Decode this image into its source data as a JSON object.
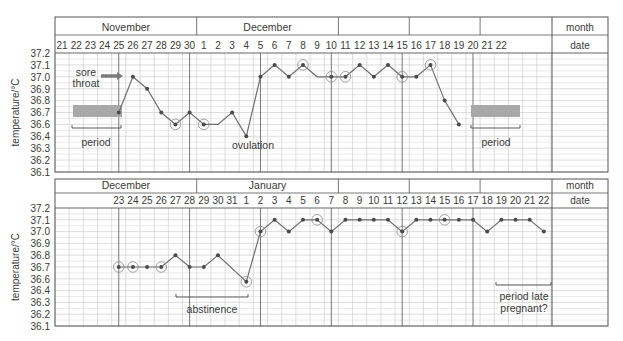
{
  "chart_data": [
    {
      "type": "line",
      "title": "Basal body temperature chart (cycle 1)",
      "ylabel": "temperature/°C",
      "y_ticks": [
        "37.2",
        "37.1",
        "37.0",
        "36.9",
        "36.8",
        "36.7",
        "36.6",
        "36.4",
        "36.3",
        "36.2",
        "36.1"
      ],
      "header_label_month": "month",
      "header_label_date": "date",
      "months": [
        {
          "label": "November",
          "from_col": 0,
          "to_col": 10
        },
        {
          "label": "December",
          "from_col": 10,
          "to_col": 20
        },
        {
          "label": "",
          "from_col": 20,
          "to_col": 25
        },
        {
          "label": "",
          "from_col": 25,
          "to_col": 30
        },
        {
          "label": "",
          "from_col": 30,
          "to_col": 35
        }
      ],
      "dates": [
        "21",
        "22",
        "23",
        "24",
        "25",
        "26",
        "27",
        "28",
        "29",
        "30",
        "1",
        "2",
        "3",
        "4",
        "5",
        "6",
        "7",
        "8",
        "9",
        "10",
        "11",
        "12",
        "13",
        "14",
        "15",
        "16",
        "17",
        "18",
        "19",
        "20",
        "21",
        "22"
      ],
      "series": [
        {
          "name": "temperature",
          "points": [
            {
              "col": 4,
              "date": "Nov 25",
              "value": 36.7,
              "circled": false,
              "marker": true
            },
            {
              "col": 5,
              "date": "Nov 26",
              "value": 37.0,
              "circled": false,
              "marker": true
            },
            {
              "col": 6,
              "date": "Nov 27",
              "value": 36.9,
              "circled": false,
              "marker": true
            },
            {
              "col": 7,
              "date": "Nov 28",
              "value": 36.7,
              "circled": false,
              "marker": true
            },
            {
              "col": 8,
              "date": "Nov 29",
              "value": 36.6,
              "circled": true,
              "marker": true
            },
            {
              "col": 9,
              "date": "Nov 30",
              "value": 36.7,
              "circled": false,
              "marker": true
            },
            {
              "col": 10,
              "date": "Dec 1",
              "value": 36.6,
              "circled": true,
              "marker": true
            },
            {
              "col": 11,
              "date": "Dec 2",
              "value": 36.6,
              "circled": false,
              "marker": false
            },
            {
              "col": 12,
              "date": "Dec 3",
              "value": 36.7,
              "circled": false,
              "marker": true
            },
            {
              "col": 13,
              "date": "Dec 4",
              "value": 36.4,
              "circled": false,
              "marker": true
            },
            {
              "col": 14,
              "date": "Dec 5",
              "value": 37.0,
              "circled": false,
              "marker": true
            },
            {
              "col": 15,
              "date": "Dec 6",
              "value": 37.1,
              "circled": false,
              "marker": true
            },
            {
              "col": 16,
              "date": "Dec 7",
              "value": 37.0,
              "circled": false,
              "marker": true
            },
            {
              "col": 17,
              "date": "Dec 8",
              "value": 37.1,
              "circled": true,
              "marker": true
            },
            {
              "col": 18,
              "date": "Dec 9",
              "value": 37.0,
              "circled": false,
              "marker": false
            },
            {
              "col": 19,
              "date": "Dec 10",
              "value": 37.0,
              "circled": true,
              "marker": true
            },
            {
              "col": 20,
              "date": "Dec 11",
              "value": 37.0,
              "circled": true,
              "marker": true
            },
            {
              "col": 21,
              "date": "Dec 12",
              "value": 37.1,
              "circled": false,
              "marker": true
            },
            {
              "col": 22,
              "date": "Dec 13",
              "value": 37.0,
              "circled": false,
              "marker": true
            },
            {
              "col": 23,
              "date": "Dec 14",
              "value": 37.1,
              "circled": false,
              "marker": true
            },
            {
              "col": 24,
              "date": "Dec 15",
              "value": 37.0,
              "circled": true,
              "marker": true
            },
            {
              "col": 25,
              "date": "Dec 16",
              "value": 37.0,
              "circled": false,
              "marker": true
            },
            {
              "col": 26,
              "date": "Dec 17",
              "value": 37.1,
              "circled": true,
              "marker": true
            },
            {
              "col": 27,
              "date": "Dec 18",
              "value": 36.8,
              "circled": false,
              "marker": true
            },
            {
              "col": 28,
              "date": "Dec 19",
              "value": 36.6,
              "circled": false,
              "marker": true
            }
          ]
        }
      ],
      "annotations": [
        {
          "kind": "text",
          "text": "sore",
          "x": 86,
          "y": 76
        },
        {
          "kind": "text",
          "text": "throat",
          "x": 86,
          "y": 87
        },
        {
          "kind": "arrow",
          "x1": 101,
          "x2": 123,
          "y": 76
        },
        {
          "kind": "bar",
          "x": 73,
          "y": 105,
          "w": 49,
          "h": 12
        },
        {
          "kind": "bracket",
          "x1": 72,
          "x2": 121,
          "y": 128
        },
        {
          "kind": "text",
          "text": "period",
          "x": 96,
          "y": 146
        },
        {
          "kind": "text",
          "text": "ovulation",
          "x": 253,
          "y": 149
        },
        {
          "kind": "bar",
          "x": 471,
          "y": 105,
          "w": 49,
          "h": 12
        },
        {
          "kind": "bracket",
          "x1": 471,
          "x2": 520,
          "y": 128
        },
        {
          "kind": "text",
          "text": "period",
          "x": 496,
          "y": 146
        }
      ],
      "grid": true
    },
    {
      "type": "line",
      "title": "Basal body temperature chart (cycle 2)",
      "ylabel": "temperature/°C",
      "y_ticks": [
        "37.2",
        "37.1",
        "37.0",
        "36.9",
        "36.8",
        "36.7",
        "36.6",
        "36.4",
        "36.3",
        "36.2",
        "36.1"
      ],
      "header_label_month": "month",
      "header_label_date": "date",
      "months": [
        {
          "label": "December",
          "from_col": 0,
          "to_col": 10
        },
        {
          "label": "January",
          "from_col": 10,
          "to_col": 20
        },
        {
          "label": "",
          "from_col": 20,
          "to_col": 25
        },
        {
          "label": "",
          "from_col": 25,
          "to_col": 30
        },
        {
          "label": "",
          "from_col": 30,
          "to_col": 35
        }
      ],
      "dates": [
        "",
        "",
        "",
        "",
        "23",
        "24",
        "25",
        "26",
        "27",
        "28",
        "29",
        "30",
        "31",
        "1",
        "2",
        "3",
        "4",
        "5",
        "6",
        "7",
        "8",
        "9",
        "10",
        "11",
        "12",
        "13",
        "14",
        "15",
        "16",
        "17",
        "18",
        "19",
        "20",
        "21",
        "22"
      ],
      "series": [
        {
          "name": "temperature",
          "points": [
            {
              "col": 4,
              "date": "Dec 23",
              "value": 36.7,
              "circled": true,
              "marker": true
            },
            {
              "col": 5,
              "date": "Dec 24",
              "value": 36.7,
              "circled": true,
              "marker": true
            },
            {
              "col": 6,
              "date": "Dec 25",
              "value": 36.7,
              "circled": false,
              "marker": true
            },
            {
              "col": 7,
              "date": "Dec 26",
              "value": 36.7,
              "circled": true,
              "marker": true
            },
            {
              "col": 8,
              "date": "Dec 27",
              "value": 36.8,
              "circled": false,
              "marker": true
            },
            {
              "col": 9,
              "date": "Dec 28",
              "value": 36.7,
              "circled": false,
              "marker": true
            },
            {
              "col": 10,
              "date": "Dec 29",
              "value": 36.7,
              "circled": false,
              "marker": true
            },
            {
              "col": 11,
              "date": "Dec 30",
              "value": 36.8,
              "circled": false,
              "marker": true
            },
            {
              "col": 13,
              "date": "Jan 1",
              "value": 36.55,
              "circled": true,
              "marker": true
            },
            {
              "col": 14,
              "date": "Jan 2",
              "value": 37.0,
              "circled": true,
              "marker": true
            },
            {
              "col": 15,
              "date": "Jan 3",
              "value": 37.1,
              "circled": false,
              "marker": true
            },
            {
              "col": 16,
              "date": "Jan 4",
              "value": 37.0,
              "circled": false,
              "marker": true
            },
            {
              "col": 17,
              "date": "Jan 5",
              "value": 37.1,
              "circled": false,
              "marker": true
            },
            {
              "col": 18,
              "date": "Jan 6",
              "value": 37.1,
              "circled": true,
              "marker": true
            },
            {
              "col": 19,
              "date": "Jan 7",
              "value": 37.0,
              "circled": false,
              "marker": true
            },
            {
              "col": 20,
              "date": "Jan 8",
              "value": 37.1,
              "circled": false,
              "marker": true
            },
            {
              "col": 21,
              "date": "Jan 9",
              "value": 37.1,
              "circled": false,
              "marker": true
            },
            {
              "col": 22,
              "date": "Jan 10",
              "value": 37.1,
              "circled": false,
              "marker": true
            },
            {
              "col": 23,
              "date": "Jan 11",
              "value": 37.1,
              "circled": false,
              "marker": true
            },
            {
              "col": 24,
              "date": "Jan 12",
              "value": 37.0,
              "circled": true,
              "marker": true
            },
            {
              "col": 25,
              "date": "Jan 13",
              "value": 37.1,
              "circled": false,
              "marker": true
            },
            {
              "col": 26,
              "date": "Jan 14",
              "value": 37.1,
              "circled": false,
              "marker": true
            },
            {
              "col": 27,
              "date": "Jan 15",
              "value": 37.1,
              "circled": true,
              "marker": true
            },
            {
              "col": 28,
              "date": "Jan 16",
              "value": 37.1,
              "circled": false,
              "marker": true
            },
            {
              "col": 29,
              "date": "Jan 17",
              "value": 37.1,
              "circled": false,
              "marker": true
            },
            {
              "col": 30,
              "date": "Jan 18",
              "value": 37.0,
              "circled": false,
              "marker": true
            },
            {
              "col": 31,
              "date": "Jan 19",
              "value": 37.1,
              "circled": false,
              "marker": true
            },
            {
              "col": 32,
              "date": "Jan 20",
              "value": 37.1,
              "circled": false,
              "marker": true
            },
            {
              "col": 33,
              "date": "Jan 21",
              "value": 37.1,
              "circled": false,
              "marker": true
            },
            {
              "col": 34,
              "date": "Jan 22",
              "value": 37.0,
              "circled": false,
              "marker": true
            }
          ]
        }
      ],
      "annotations": [
        {
          "kind": "bracket",
          "x1": 176,
          "x2": 248,
          "y": 297
        },
        {
          "kind": "text",
          "text": "abstinence",
          "x": 212,
          "y": 313
        },
        {
          "kind": "bracket",
          "x1": 496,
          "x2": 551,
          "y": 285
        },
        {
          "kind": "text",
          "text": "period late",
          "x": 524,
          "y": 300
        },
        {
          "kind": "text",
          "text": "pregnant?",
          "x": 524,
          "y": 312
        }
      ],
      "grid": true
    }
  ],
  "colors": {
    "line": "#707070",
    "marker": "#4a4a4a",
    "grid_minor": "#d4d4d4",
    "grid_major": "#555555",
    "text": "#3a3a3a",
    "bar": "#a8a8a8",
    "arrow": "#7a7a7a"
  }
}
